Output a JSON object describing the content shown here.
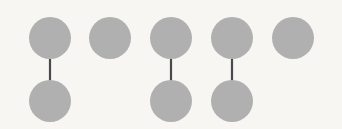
{
  "figure": {
    "canvas": {
      "width": 342,
      "height": 129,
      "background_color": "#f7f6f3"
    },
    "style": {
      "node_fill": "#b0b0b0",
      "node_radius": 21,
      "edge_color": "#4a4a4a",
      "edge_width": 2.2
    },
    "nodes": [
      {
        "id": "t1",
        "row": "top",
        "column": 1,
        "cx": 50,
        "cy": 38,
        "r": 21,
        "fill": "#b0b0b0"
      },
      {
        "id": "t2",
        "row": "top",
        "column": 2,
        "cx": 110,
        "cy": 38,
        "r": 21,
        "fill": "#b0b0b0"
      },
      {
        "id": "t3",
        "row": "top",
        "column": 3,
        "cx": 171,
        "cy": 38,
        "r": 21,
        "fill": "#b0b0b0"
      },
      {
        "id": "t4",
        "row": "top",
        "column": 4,
        "cx": 232,
        "cy": 38,
        "r": 21,
        "fill": "#b0b0b0"
      },
      {
        "id": "t5",
        "row": "top",
        "column": 5,
        "cx": 293,
        "cy": 38,
        "r": 21,
        "fill": "#b0b0b0"
      },
      {
        "id": "b1",
        "row": "bottom",
        "column": 1,
        "cx": 50,
        "cy": 101,
        "r": 21,
        "fill": "#b0b0b0"
      },
      {
        "id": "b3",
        "row": "bottom",
        "column": 3,
        "cx": 171,
        "cy": 101,
        "r": 21,
        "fill": "#b0b0b0"
      },
      {
        "id": "b4",
        "row": "bottom",
        "column": 4,
        "cx": 232,
        "cy": 101,
        "r": 21,
        "fill": "#b0b0b0"
      }
    ],
    "edges": [
      {
        "id": "e1",
        "from": "t1",
        "to": "b1",
        "x": 50,
        "y1": 38,
        "y2": 102,
        "stroke": "#4a4a4a",
        "width": 2.2
      },
      {
        "id": "e2",
        "from": "t3",
        "to": "b3",
        "x": 171,
        "y1": 38,
        "y2": 102,
        "stroke": "#4a4a4a",
        "width": 2.2
      },
      {
        "id": "e3",
        "from": "t4",
        "to": "b4",
        "x": 232,
        "y1": 38,
        "y2": 100,
        "stroke": "#4a4a4a",
        "width": 2.2
      }
    ],
    "counts": {
      "top_nodes": 5,
      "bottom_nodes": 3,
      "edges": 3
    }
  }
}
